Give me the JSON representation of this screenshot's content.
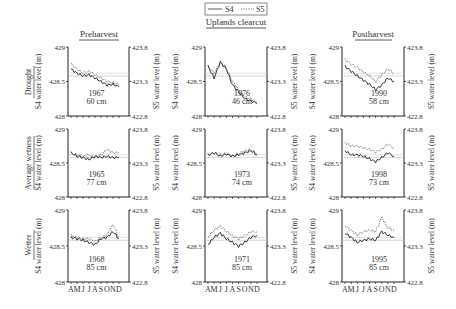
{
  "legend": {
    "s4": "S4",
    "s5": "S5"
  },
  "columns": [
    "Preharvest",
    "Uplands clearcut",
    "Postharvest"
  ],
  "rows": [
    "Drought",
    "Average wetness",
    "Wetter"
  ],
  "left_axis_label": "S4 water level (m)",
  "right_axis_label": "S5 water level (m)",
  "left_ticks": [
    "429",
    "428.5",
    "428"
  ],
  "right_ticks": [
    "423.8",
    "423.3",
    "422.8"
  ],
  "months": [
    "A",
    "M",
    "J",
    "J",
    "A",
    "S",
    "O",
    "N",
    "D"
  ],
  "chart_data": {
    "type": "line",
    "title": "",
    "xlabel": "Month (Apr–Dec)",
    "ylabel": "S4 water level (m)",
    "ylabel_right": "S5 water level (m)",
    "ylim": [
      428,
      429
    ],
    "ylim_right": [
      422.8,
      423.8
    ],
    "x": [
      "A",
      "M",
      "J",
      "J",
      "A",
      "S",
      "O",
      "N",
      "D"
    ],
    "legend": [
      "S4 (solid)",
      "S5 (dotted)"
    ],
    "panels": [
      {
        "row": "Drought",
        "column": "Preharvest",
        "year": "1967",
        "precip": "60 cm",
        "S4": [
          428.68,
          428.62,
          428.58,
          428.6,
          428.55,
          428.5,
          428.45,
          428.46,
          428.42
        ],
        "S5": [
          423.56,
          423.48,
          423.42,
          423.45,
          423.4,
          423.35,
          423.3,
          423.28,
          423.25
        ]
      },
      {
        "row": "Drought",
        "column": "Uplands clearcut",
        "year": "1976",
        "precip": "46 cm",
        "S4": [
          428.72,
          428.55,
          428.78,
          428.68,
          428.45,
          428.35,
          428.25,
          428.22,
          428.18
        ],
        "S5": [
          423.52,
          423.42,
          423.58,
          423.5,
          423.3,
          423.18,
          423.08,
          423.05,
          423.0
        ]
      },
      {
        "row": "Drought",
        "column": "Postharvest",
        "year": "1990",
        "precip": "58 cm",
        "S4": [
          428.72,
          428.65,
          428.58,
          428.52,
          428.46,
          428.38,
          428.45,
          428.55,
          428.5
        ],
        "S5": [
          423.62,
          423.55,
          423.5,
          423.44,
          423.38,
          423.3,
          423.4,
          423.48,
          423.42
        ]
      },
      {
        "row": "Average wetness",
        "column": "Preharvest",
        "year": "1965",
        "precip": "77 cm",
        "S4": [
          428.65,
          428.6,
          428.58,
          428.55,
          428.6,
          428.58,
          428.6,
          428.58,
          428.58
        ],
        "S5": [
          423.45,
          423.42,
          423.4,
          423.42,
          423.38,
          423.42,
          423.5,
          423.45,
          423.45
        ]
      },
      {
        "row": "Average wetness",
        "column": "Uplands clearcut",
        "year": "1973",
        "precip": "74 cm",
        "S4": [
          428.62,
          428.65,
          428.6,
          428.63,
          428.6,
          428.62,
          428.65,
          428.68,
          428.62
        ],
        "S5": [
          423.42,
          423.45,
          423.42,
          423.44,
          423.4,
          423.44,
          423.48,
          423.5,
          423.44
        ]
      },
      {
        "row": "Average wetness",
        "column": "Postharvest",
        "year": "1998",
        "precip": "73 cm",
        "S4": [
          428.68,
          428.62,
          428.62,
          428.6,
          428.56,
          428.52,
          428.58,
          428.65,
          428.6
        ],
        "S5": [
          423.6,
          423.55,
          423.55,
          423.52,
          423.5,
          423.46,
          423.5,
          423.58,
          423.52
        ]
      },
      {
        "row": "Wetter",
        "column": "Preharvest",
        "year": "1968",
        "precip": "85 cm",
        "S4": [
          428.62,
          428.6,
          428.58,
          428.55,
          428.52,
          428.6,
          428.62,
          428.7,
          428.6
        ],
        "S5": [
          423.45,
          423.42,
          423.4,
          423.4,
          423.36,
          423.42,
          423.45,
          423.6,
          423.42
        ]
      },
      {
        "row": "Wetter",
        "column": "Uplands clearcut",
        "year": "1971",
        "precip": "85 cm",
        "S4": [
          428.52,
          428.62,
          428.68,
          428.6,
          428.55,
          428.5,
          428.55,
          428.62,
          428.65
        ],
        "S5": [
          423.42,
          423.52,
          423.58,
          423.5,
          423.44,
          423.4,
          423.44,
          423.5,
          423.5
        ]
      },
      {
        "row": "Wetter",
        "column": "Postharvest",
        "year": "1995",
        "precip": "85 cm",
        "S4": [
          428.68,
          428.62,
          428.55,
          428.58,
          428.6,
          428.58,
          428.7,
          428.65,
          428.62
        ],
        "S5": [
          423.58,
          423.52,
          423.45,
          423.5,
          423.52,
          423.5,
          423.7,
          423.55,
          423.52
        ]
      }
    ]
  }
}
